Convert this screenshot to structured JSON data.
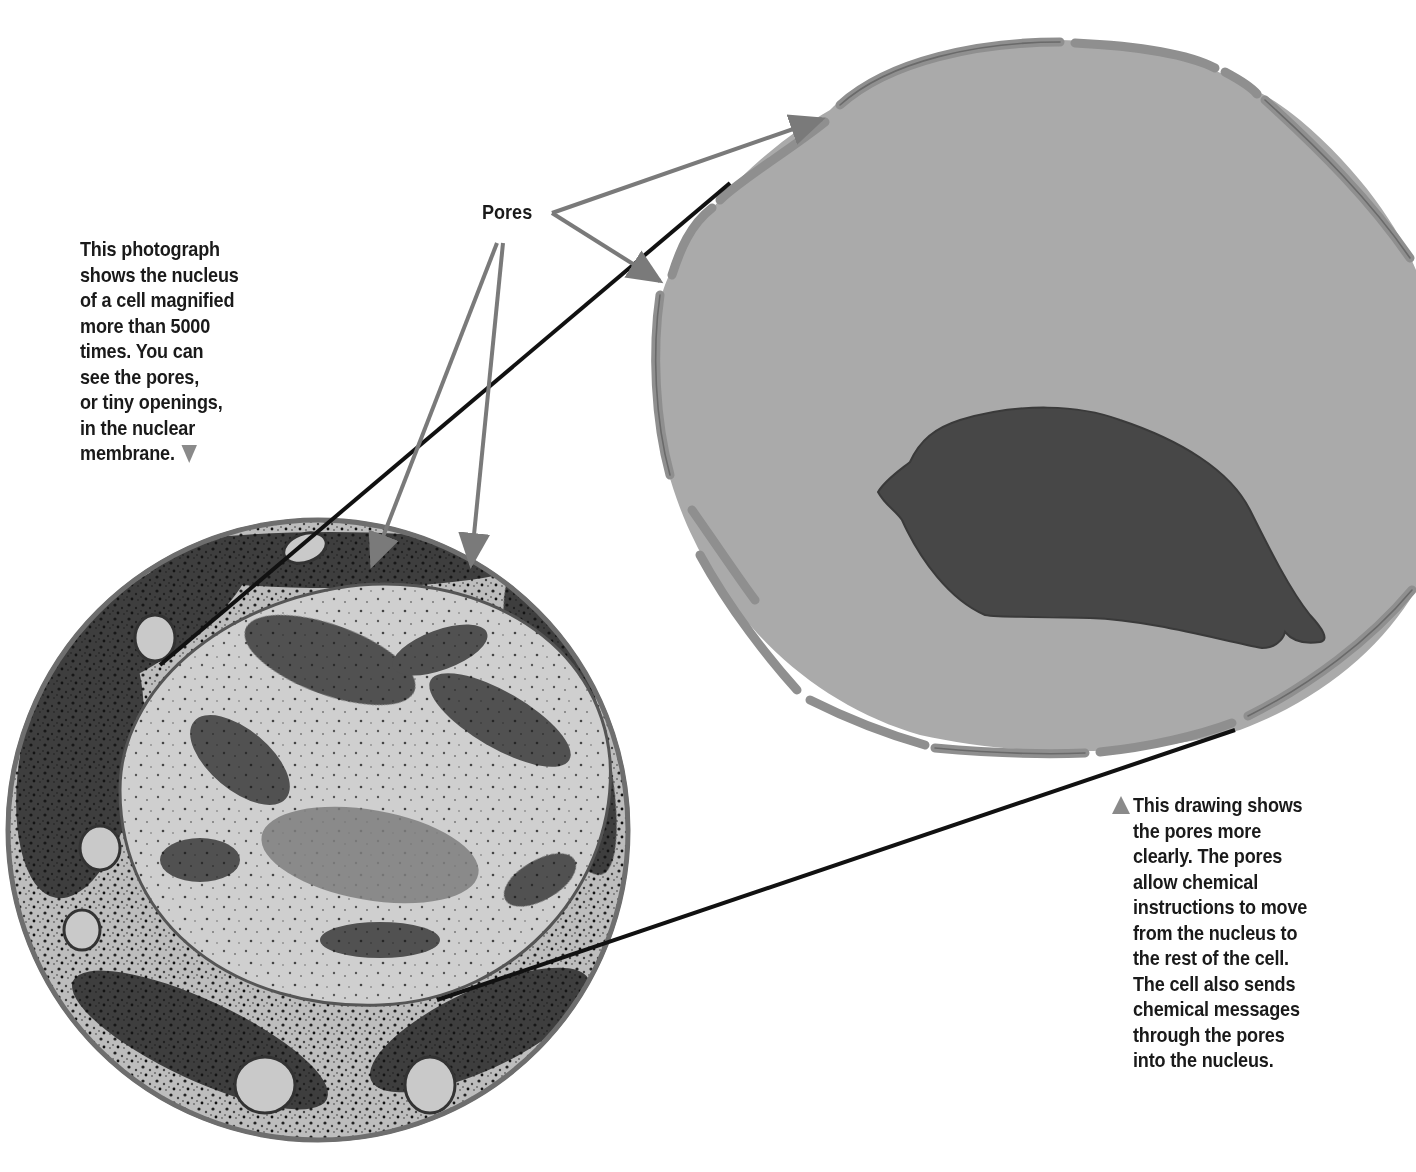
{
  "labels": {
    "pores": "Pores"
  },
  "captions": {
    "photo": {
      "lines": [
        "This photograph",
        "shows the nucleus",
        "of a cell magnified",
        "more than 5000",
        "times. You can",
        "see the pores,",
        "or tiny openings,",
        "in the nuclear",
        "membrane."
      ],
      "pointer_icon": "triangle-down-icon"
    },
    "drawing": {
      "lines": [
        "This drawing shows",
        "the pores more",
        "clearly. The pores",
        "allow chemical",
        "instructions to move",
        "from the nucleus to",
        "the rest of the cell.",
        "The cell also sends",
        "chemical messages",
        "through the pores",
        "into the nucleus."
      ],
      "pointer_icon": "triangle-up-icon"
    }
  },
  "colors": {
    "cell_fill": "#a9a9a9",
    "membrane": "#8c8c8c",
    "membrane_outline": "#6a6a6a",
    "nucleolus": "#4a4a4a",
    "pointer_gray": "#7a7a7a",
    "connector_black": "#111111",
    "photo_rim": "#6e6e6e"
  },
  "diagram": {
    "photo_circle": {
      "cx": 318,
      "cy": 830,
      "r": 312
    },
    "drawing_center": [
      1050,
      400
    ],
    "connectors": [
      {
        "from": [
          160,
          665
        ],
        "to": [
          730,
          183
        ]
      },
      {
        "from": [
          437,
          1000
        ],
        "to": [
          1235,
          730
        ]
      }
    ],
    "pore_pointers": [
      {
        "from": [
          552,
          213
        ],
        "to": [
          828,
          116
        ]
      },
      {
        "from": [
          552,
          213
        ],
        "to": [
          665,
          285
        ]
      },
      {
        "from": [
          497,
          243
        ],
        "to": [
          370,
          570
        ]
      },
      {
        "from": [
          503,
          243
        ],
        "to": [
          470,
          570
        ]
      }
    ]
  }
}
